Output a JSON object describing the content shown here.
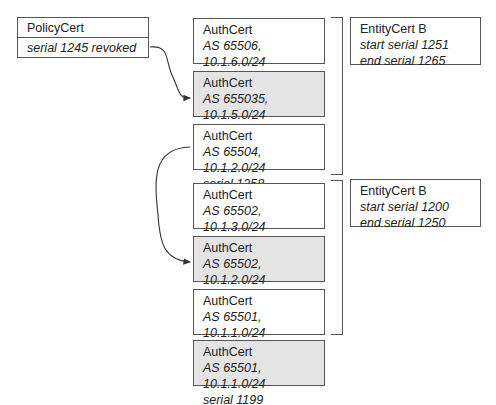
{
  "policy_cert": {
    "title": "PolicyCert",
    "line": "serial 1245 revoked"
  },
  "auth_certs": [
    {
      "title": "AuthCert",
      "as_prefix": "AS 65506, 10.1.6.0/24",
      "serial": "serial 1260",
      "shaded": false
    },
    {
      "title": "AuthCert",
      "as_prefix": "AS 655035, 10.1.5.0/24",
      "serial": "serial 1259",
      "shaded": true
    },
    {
      "title": "AuthCert",
      "as_prefix": "AS 65504, 10.1.2.0/24",
      "serial": "serial 1258",
      "shaded": false
    },
    {
      "title": "AuthCert",
      "as_prefix": "AS 65502, 10.1.3.0/24",
      "serial": "serial 1245",
      "shaded": false
    },
    {
      "title": "AuthCert",
      "as_prefix": "AS 65502, 10.1.2.0/24",
      "serial": "serial 1226",
      "shaded": true
    },
    {
      "title": "AuthCert",
      "as_prefix": "AS 65501, 10.1.1.0/24",
      "serial": "serial 1204",
      "shaded": false
    },
    {
      "title": "AuthCert",
      "as_prefix": "AS 65501, 10.1.1.0/24",
      "serial": "serial 1199",
      "shaded": true
    }
  ],
  "entity_certs": [
    {
      "title": "EntityCert B",
      "start": "start serial 1251",
      "end": "end serial 1265"
    },
    {
      "title": "EntityCert B",
      "start": "start serial 1200",
      "end": "end serial 1250"
    }
  ],
  "arrows": [
    {
      "from": "policy_cert",
      "to": "auth_certs.1"
    },
    {
      "from": "auth_certs.2",
      "to": "auth_certs.4"
    }
  ],
  "colors": {
    "border": "#555555",
    "shaded_fill": "#e4e4e4",
    "text": "#222222"
  }
}
